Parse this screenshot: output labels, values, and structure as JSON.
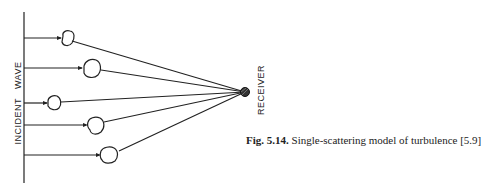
{
  "diagram": {
    "incident_label": "INCIDENT   WAVE",
    "receiver_label": "RECEIVER",
    "caption": {
      "number": "Fig. 5.14.",
      "text": " Single-scattering model of turbulence [5.9]"
    },
    "colors": {
      "line": "#222222",
      "background": "#ffffff"
    }
  }
}
